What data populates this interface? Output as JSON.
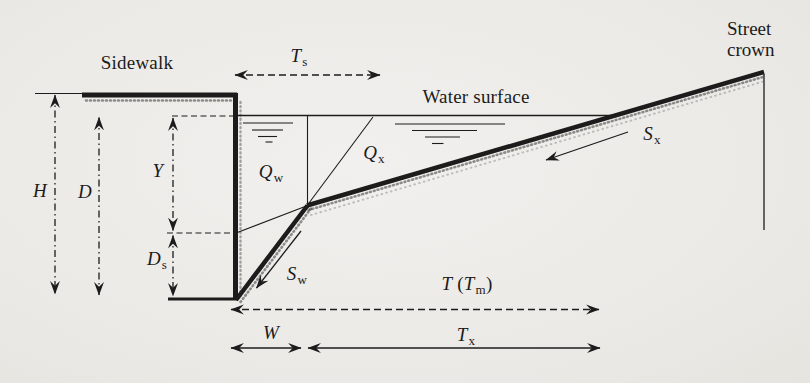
{
  "figure": {
    "colors": {
      "ink": "#1c1c1c",
      "background": "#ebe9e5"
    },
    "labels": {
      "sidewalk": "Sidewalk",
      "water_surface": "Water surface",
      "street_crown": {
        "line1": "Street",
        "line2": "crown"
      }
    },
    "vars": {
      "ts": {
        "main": "T",
        "sub": "s"
      },
      "h": {
        "main": "H"
      },
      "d": {
        "main": "D"
      },
      "y": {
        "main": "Y"
      },
      "ds": {
        "main": "D",
        "sub": "s"
      },
      "qw": {
        "main": "Q",
        "sub": "w"
      },
      "qx": {
        "main": "Q",
        "sub": "x"
      },
      "sw": {
        "main": "S",
        "sub": "w"
      },
      "sx": {
        "main": "S",
        "sub": "x"
      },
      "w": {
        "main": "W"
      },
      "tx": {
        "main": "T",
        "sub": "x"
      },
      "t_tm": {
        "t1": "T",
        "open": " (",
        "t2": "T",
        "sub": "m",
        "close": ")"
      }
    }
  }
}
